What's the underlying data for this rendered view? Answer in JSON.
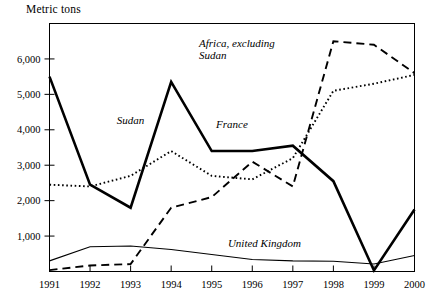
{
  "chart_data": {
    "type": "line",
    "title": "",
    "ylabel": "Metric tons",
    "xlabel": "",
    "categories": [
      "1991",
      "1992",
      "1993",
      "1994",
      "1995",
      "1996",
      "1997",
      "1998",
      "1999",
      "2000"
    ],
    "x": [
      1991,
      1992,
      1993,
      1994,
      1995,
      1996,
      1997,
      1998,
      1999,
      2000
    ],
    "ylim": [
      0,
      7000
    ],
    "xlim": [
      1991,
      2000
    ],
    "yticks": [
      1000,
      2000,
      3000,
      4000,
      5000,
      6000
    ],
    "ytick_labels": [
      "1,000",
      "2,000",
      "3,000",
      "4,000",
      "5,000",
      "6,000"
    ],
    "grid": false,
    "legend_position": "inline-annotations",
    "series": [
      {
        "name": "Sudan",
        "style": "solid-thick",
        "color": "#000000",
        "values": [
          5500,
          2450,
          1800,
          5350,
          3400,
          3400,
          3550,
          2550,
          30,
          1750
        ],
        "label": "Sudan",
        "label_x": 1993.0,
        "label_y": 4150
      },
      {
        "name": "France",
        "style": "dotted",
        "color": "#000000",
        "values": [
          2450,
          2400,
          2700,
          3400,
          2700,
          2600,
          3200,
          5100,
          5300,
          5550
        ],
        "label": "France",
        "label_x": 1995.5,
        "label_y": 4050
      },
      {
        "name": "Africa, excluding Sudan",
        "style": "dashed",
        "color": "#000000",
        "values": [
          40,
          170,
          210,
          1800,
          2100,
          3100,
          2400,
          6500,
          6400,
          5600
        ],
        "label": "Africa, excluding\nSudan",
        "label_x": 1995.6,
        "label_y": 6350
      },
      {
        "name": "United Kingdom",
        "style": "solid-thin",
        "color": "#000000",
        "values": [
          300,
          700,
          720,
          620,
          480,
          340,
          300,
          290,
          210,
          450
        ],
        "label": "United Kingdom",
        "label_x": 1996.3,
        "label_y": 690
      }
    ],
    "annotations": [
      {
        "text": "Metric tons",
        "position": "top-left-axis-title"
      }
    ]
  }
}
